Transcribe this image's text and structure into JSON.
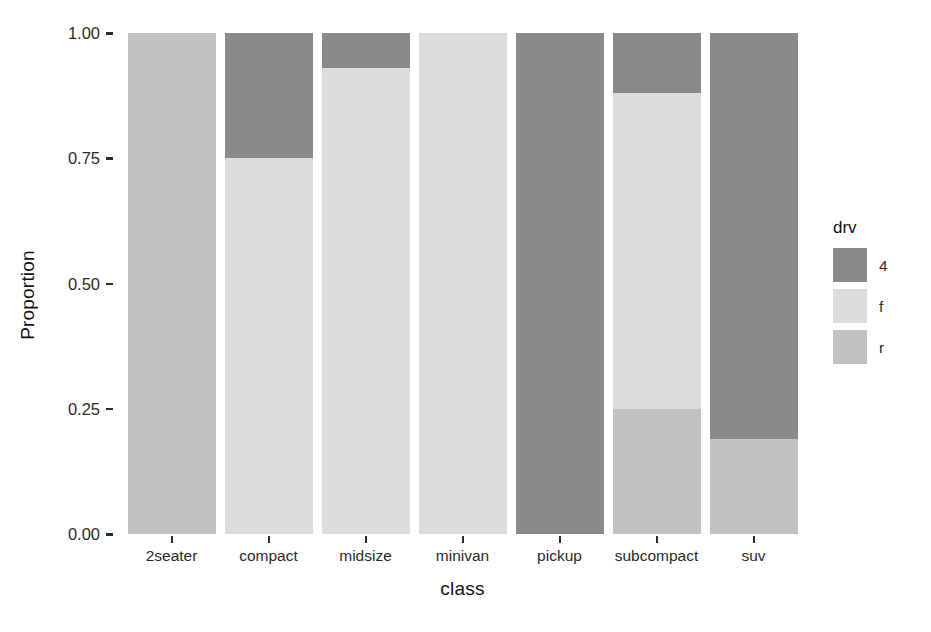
{
  "chart_data": {
    "type": "bar",
    "subtype": "stacked-proportion",
    "title": "",
    "xlabel": "class",
    "ylabel": "Proportion",
    "categories": [
      "2seater",
      "compact",
      "midsize",
      "minivan",
      "pickup",
      "subcompact",
      "suv"
    ],
    "ylim": [
      0,
      1
    ],
    "ytick_labels": [
      "0.00",
      "0.25",
      "0.50",
      "0.75",
      "1.00"
    ],
    "ytick_values": [
      0,
      0.25,
      0.5,
      0.75,
      1
    ],
    "grid": false,
    "legend": {
      "title": "drv",
      "position": "right",
      "entries": [
        {
          "label": "4",
          "color": "#8a8a8a"
        },
        {
          "label": "f",
          "color": "#dcdcdc"
        },
        {
          "label": "r",
          "color": "#c2c2c2"
        }
      ]
    },
    "series": [
      {
        "name": "4",
        "color": "#8a8a8a",
        "values": [
          0.0,
          0.25,
          0.07,
          0.0,
          1.0,
          0.12,
          0.81
        ]
      },
      {
        "name": "f",
        "color": "#dcdcdc",
        "values": [
          0.0,
          0.75,
          0.93,
          1.0,
          0.0,
          0.63,
          0.0
        ]
      },
      {
        "name": "r",
        "color": "#c2c2c2",
        "values": [
          1.0,
          0.0,
          0.0,
          0.0,
          0.0,
          0.25,
          0.19
        ]
      }
    ],
    "stack_order_top_to_bottom": [
      "4",
      "f",
      "r"
    ]
  },
  "axes": {
    "y_title": "Proportion",
    "x_title": "class"
  },
  "colors": {
    "background": "#ffffff",
    "axis_text": "#2b2b2b",
    "axis_title": "#131313",
    "drv_4": "#8a8a8a",
    "drv_f": "#dcdcdc",
    "drv_r": "#c2c2c2"
  }
}
